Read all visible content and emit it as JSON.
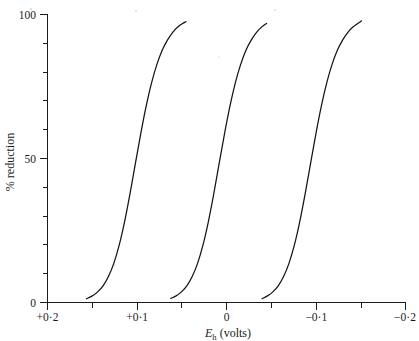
{
  "chart_data": {
    "type": "line",
    "title": "",
    "xlabel": "E_h (volts)",
    "xlabel_parts": {
      "symbol": "E",
      "subscript": "h",
      "units": "(volts)"
    },
    "ylabel": "% reduction",
    "xlim": [
      0.2,
      -0.2
    ],
    "ylim": [
      0,
      100
    ],
    "x_axis_reversed": true,
    "grid": false,
    "legend": "none",
    "x_tick_labels": [
      "+0·2",
      "+0·1",
      "0",
      "−0·1",
      "−0·2"
    ],
    "x_tick_values": [
      0.2,
      0.1,
      0,
      -0.1,
      -0.2
    ],
    "x_minor_tick_values": [
      0.15,
      0.05,
      -0.05,
      -0.15
    ],
    "y_tick_labels": [
      "100",
      "50",
      "0"
    ],
    "y_tick_values": [
      100,
      50,
      0
    ],
    "y_minor_tick_values": [
      10,
      20,
      30,
      40,
      60,
      70,
      80,
      90
    ],
    "series": [
      {
        "name": "curve-1",
        "midpoint_volts": 0.102,
        "slope": 0.0205,
        "x_start_volts": 0.1565,
        "x_end_volts": 0.0455,
        "points": [
          [
            0.1565,
            1.3
          ],
          [
            0.15,
            2.3
          ],
          [
            0.144,
            3.7
          ],
          [
            0.138,
            5.8
          ],
          [
            0.132,
            9.0
          ],
          [
            0.126,
            13.6
          ],
          [
            0.12,
            19.9
          ],
          [
            0.114,
            28.0
          ],
          [
            0.108,
            37.6
          ],
          [
            0.102,
            48.1
          ],
          [
            0.096,
            58.5
          ],
          [
            0.09,
            68.0
          ],
          [
            0.084,
            76.1
          ],
          [
            0.078,
            82.6
          ],
          [
            0.072,
            87.6
          ],
          [
            0.066,
            91.2
          ],
          [
            0.06,
            93.9
          ],
          [
            0.054,
            95.8
          ],
          [
            0.048,
            97.1
          ],
          [
            0.0455,
            97.5
          ]
        ]
      },
      {
        "name": "curve-2",
        "midpoint_volts": 0.009,
        "slope": 0.0205,
        "x_start_volts": 0.0625,
        "x_end_volts": -0.0445,
        "points": [
          [
            0.0625,
            1.4
          ],
          [
            0.0565,
            2.3
          ],
          [
            0.0505,
            3.7
          ],
          [
            0.0445,
            5.8
          ],
          [
            0.0385,
            9.0
          ],
          [
            0.0325,
            13.6
          ],
          [
            0.0265,
            19.9
          ],
          [
            0.0205,
            28.0
          ],
          [
            0.0145,
            37.6
          ],
          [
            0.0085,
            48.1
          ],
          [
            0.0025,
            58.5
          ],
          [
            -0.0035,
            68.0
          ],
          [
            -0.0095,
            76.1
          ],
          [
            -0.0155,
            82.6
          ],
          [
            -0.0215,
            87.6
          ],
          [
            -0.0275,
            91.2
          ],
          [
            -0.0335,
            93.9
          ],
          [
            -0.0395,
            95.8
          ],
          [
            -0.0445,
            96.9
          ]
        ]
      },
      {
        "name": "curve-3",
        "midpoint_volts": -0.093,
        "slope": 0.0205,
        "x_start_volts": -0.0395,
        "x_end_volts": -0.1505,
        "points": [
          [
            -0.0395,
            1.3
          ],
          [
            -0.0455,
            2.3
          ],
          [
            -0.0515,
            3.7
          ],
          [
            -0.0575,
            5.8
          ],
          [
            -0.0635,
            9.0
          ],
          [
            -0.0695,
            13.6
          ],
          [
            -0.0755,
            19.9
          ],
          [
            -0.0815,
            28.0
          ],
          [
            -0.0875,
            37.6
          ],
          [
            -0.0935,
            48.1
          ],
          [
            -0.0995,
            58.5
          ],
          [
            -0.1055,
            68.0
          ],
          [
            -0.1115,
            76.1
          ],
          [
            -0.1175,
            82.6
          ],
          [
            -0.1235,
            87.6
          ],
          [
            -0.1295,
            91.2
          ],
          [
            -0.1355,
            93.9
          ],
          [
            -0.1415,
            95.8
          ],
          [
            -0.1505,
            97.8
          ]
        ]
      }
    ],
    "colors": {
      "curve": "#141414",
      "axis": "#1b1b1b",
      "background": "#ffffff",
      "text": "#1a1a1a"
    }
  }
}
